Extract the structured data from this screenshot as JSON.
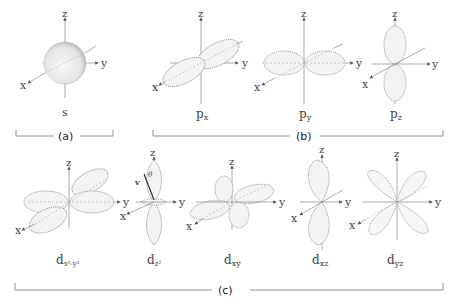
{
  "groups": [
    {
      "id": "a",
      "label": "(a)",
      "orbitals": [
        {
          "name": "s",
          "sub": ""
        }
      ]
    },
    {
      "id": "b",
      "label": "(b)",
      "orbitals": [
        {
          "name": "p",
          "sub": "x"
        },
        {
          "name": "p",
          "sub": "y"
        },
        {
          "name": "p",
          "sub": "z"
        }
      ]
    },
    {
      "id": "c",
      "label": "(c)",
      "orbitals": [
        {
          "name": "d",
          "sub": "x²-y²"
        },
        {
          "name": "d",
          "sub": "z²"
        },
        {
          "name": "d",
          "sub": "xy"
        },
        {
          "name": "d",
          "sub": "xz"
        },
        {
          "name": "d",
          "sub": "yz"
        }
      ]
    }
  ],
  "axes": {
    "x": "x",
    "y": "y",
    "z": "z"
  },
  "annotations": {
    "dz2_angle": "θ",
    "dz2_vector": "v"
  }
}
